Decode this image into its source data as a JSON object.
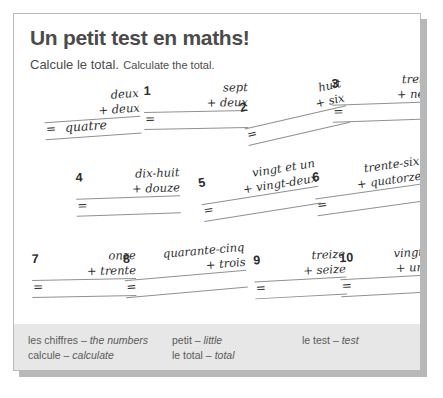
{
  "worksheet": {
    "title": "Un petit test en maths!",
    "instruction_fr": "Calcule le total.",
    "instruction_en": "Calculate the total.",
    "example": {
      "number": "",
      "term1": "deux",
      "term2": "+ deux",
      "equals": "=",
      "answer": "quatre"
    },
    "problems": [
      {
        "number": "1",
        "term1": "sept",
        "term2": "+ deux",
        "equals": "=",
        "answer": ""
      },
      {
        "number": "2",
        "term1": "huit",
        "term2": "+ six",
        "equals": "=",
        "answer": ""
      },
      {
        "number": "3",
        "term1": "treize",
        "term2": "+ neuf",
        "equals": "=",
        "answer": ""
      },
      {
        "number": "4",
        "term1": "dix-huit",
        "term2": "+ douze",
        "equals": "=",
        "answer": ""
      },
      {
        "number": "5",
        "term1": "vingt et un",
        "term2": "+ vingt-deux",
        "equals": "=",
        "answer": ""
      },
      {
        "number": "6",
        "term1": "trente-six",
        "term2": "+ quatorze",
        "equals": "=",
        "answer": ""
      },
      {
        "number": "7",
        "term1": "onze",
        "term2": "+ trente",
        "equals": "=",
        "answer": ""
      },
      {
        "number": "8",
        "term1": "quarante-cinq",
        "term2": "+ trois",
        "equals": "=",
        "answer": ""
      },
      {
        "number": "9",
        "term1": "treize",
        "term2": "+ seize",
        "equals": "=",
        "answer": ""
      },
      {
        "number": "10",
        "term1": "vingt",
        "term2": "+ un",
        "equals": "=",
        "answer": ""
      }
    ],
    "glossary": [
      {
        "fr": "les chiffres – ",
        "en": "the numbers"
      },
      {
        "fr": "calcule – ",
        "en": "calculate"
      },
      {
        "fr": "petit – ",
        "en": "little"
      },
      {
        "fr": "le total – ",
        "en": "total"
      },
      {
        "fr": "le test – ",
        "en": "test"
      }
    ]
  },
  "colors": {
    "page_border": "#b9b9b9",
    "shadow": "#b6b8ba",
    "title_text": "#4b4b4b",
    "body_text": "#2e2e2e",
    "rule_line": "#909090",
    "footer_band": "#e7e7e7",
    "glossary_text": "#5a5a5a"
  }
}
